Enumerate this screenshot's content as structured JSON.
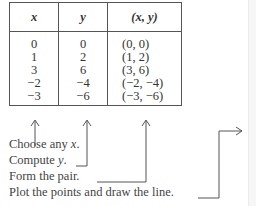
{
  "table": {
    "headers": [
      "x",
      "y",
      "(x, y)"
    ],
    "rows": [
      [
        "0",
        "0",
        "(0, 0)"
      ],
      [
        "1",
        "2",
        "(1, 2)"
      ],
      [
        "3",
        "6",
        "(3, 6)"
      ],
      [
        "−2",
        "−4",
        "(−2, −4)"
      ],
      [
        "−3",
        "−6",
        "(−3, −6)"
      ]
    ]
  },
  "steps": [
    {
      "text": "Choose any ",
      "var": "x",
      "end": "."
    },
    {
      "text": "Compute ",
      "var": "y",
      "end": "."
    },
    {
      "text": "Form the pair.",
      "var": "",
      "end": ""
    },
    {
      "text": "Plot the points and draw the line.",
      "var": "",
      "end": ""
    }
  ],
  "colors": {
    "lines": "#555555",
    "text": "#444444"
  }
}
